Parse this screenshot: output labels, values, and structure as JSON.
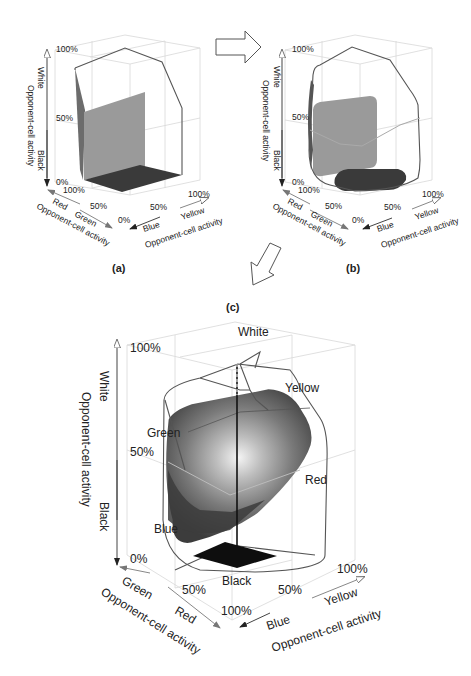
{
  "panels": {
    "a": {
      "caption": "(a)",
      "vertical_axis": {
        "title": "Opponent-cell activity",
        "top": "White",
        "bottom": "Black",
        "ticks": [
          "100%",
          "50%",
          "0%"
        ]
      },
      "left_axis": {
        "title": "Opponent-cell activity",
        "end_a": "Red",
        "end_b": "Green",
        "ticks": [
          "100%",
          "50%"
        ]
      },
      "right_axis": {
        "title": "Opponent-cell activity",
        "end_a": "Blue",
        "end_b": "Yellow",
        "ticks": [
          "0%",
          "50%",
          "100%"
        ]
      }
    },
    "b": {
      "caption": "(b)",
      "vertical_axis": {
        "title": "Opponent-cell activity",
        "top": "White",
        "bottom": "Black",
        "ticks": [
          "100%",
          "50%",
          "0%"
        ]
      },
      "left_axis": {
        "title": "Opponent-cell activity",
        "end_a": "Red",
        "end_b": "Green",
        "ticks": [
          "100%",
          "50%"
        ]
      },
      "right_axis": {
        "title": "Opponent-cell activity",
        "end_a": "Blue",
        "end_b": "Yellow",
        "ticks": [
          "0%",
          "50%",
          "100%"
        ]
      }
    },
    "c": {
      "caption": "(c)",
      "vertical_axis": {
        "title": "Opponent-cell activity",
        "top": "White",
        "bottom": "Black",
        "ticks": [
          "100%",
          "50%",
          "0%"
        ]
      },
      "left_axis": {
        "title": "Opponent-cell activity",
        "end_a": "Green",
        "end_b": "Red",
        "ticks": [
          "50%",
          "100%"
        ]
      },
      "right_axis": {
        "title": "Opponent-cell activity",
        "end_a": "Blue",
        "end_b": "Yellow",
        "ticks": [
          "50%",
          "100%"
        ]
      },
      "surface_labels": {
        "white": "White",
        "yellow": "Yellow",
        "green": "Green",
        "red": "Red",
        "blue": "Blue",
        "black": "Black"
      }
    }
  },
  "colors": {
    "plane_mid": "#9a9a9a",
    "plane_dark": "#3a3a3a",
    "floor_black": "#111111",
    "grid": "#d8d8d8"
  }
}
